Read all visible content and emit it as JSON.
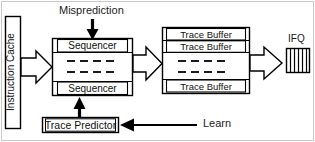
{
  "diagram": {
    "type": "block-diagram",
    "background": "#ffffff",
    "line_color": "#000000",
    "text_color": "#111111",
    "frame_color": "#c9c9c9"
  },
  "labels": {
    "misprediction": "Misprediction",
    "learn": "Learn",
    "ifq": "IFQ",
    "instruction_cache": "Instruction Cache"
  },
  "blocks": {
    "instruction_cache": {
      "name": "Instruction Cache",
      "orientation": "vertical"
    },
    "sequencer_unit": {
      "rows": [
        {
          "label": "Sequencer",
          "kind": "labeled"
        },
        {
          "label": "",
          "kind": "ellipsis"
        },
        {
          "label": "Sequencer",
          "kind": "labeled"
        }
      ],
      "ellipsis_rows": 2,
      "ellipsis_dashes": 4
    },
    "trace_buffer_unit": {
      "rows": [
        {
          "label": "Trace Buffer",
          "kind": "labeled"
        },
        {
          "label": "Trace Buffer",
          "kind": "labeled"
        },
        {
          "label": "",
          "kind": "ellipsis"
        },
        {
          "label": "Trace Buffer",
          "kind": "labeled"
        }
      ],
      "ellipsis_rows": 2,
      "ellipsis_dashes": 4
    },
    "trace_predictor": {
      "label": "Trace Predictor"
    },
    "ifq": {
      "label": "IFQ",
      "slots": 6
    }
  },
  "connections": [
    {
      "from": "Instruction Cache",
      "to": "Sequencer unit",
      "style": "block-arrow",
      "direction": "right"
    },
    {
      "from": "Sequencer unit",
      "to": "Trace Buffer unit",
      "style": "block-arrow",
      "direction": "right"
    },
    {
      "from": "Trace Buffer unit",
      "to": "IFQ",
      "style": "block-arrow",
      "direction": "right"
    },
    {
      "from": "Misprediction",
      "to": "Sequencer unit",
      "style": "solid-arrow",
      "direction": "down"
    },
    {
      "from": "Trace Predictor",
      "to": "Sequencer unit",
      "style": "solid-arrow",
      "direction": "up"
    },
    {
      "from": "Learn",
      "to": "Trace Predictor",
      "style": "solid-arrow",
      "direction": "left"
    }
  ]
}
